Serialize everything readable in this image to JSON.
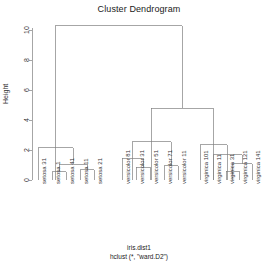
{
  "title": "Cluster Dendrogram",
  "axis": {
    "ylabel": "Height",
    "yticks": [
      "0",
      "2",
      "4",
      "6",
      "8",
      "10"
    ]
  },
  "caption": {
    "line1": "iris.dist1",
    "line2": "hclust (*, \"ward.D2\")"
  },
  "colors": {
    "line": "#808080",
    "axis": "#808080",
    "text": "#1a1a1a"
  },
  "chart_data": {
    "type": "dendrogram",
    "title": "Cluster Dendrogram",
    "xlabel": "iris.dist1",
    "sublabel": "hclust (*, \"ward.D2\")",
    "ylabel": "Height",
    "ylim": [
      0,
      10.8
    ],
    "ytick_values": [
      0,
      2,
      4,
      6,
      8,
      10
    ],
    "grid": false,
    "leaf_labels": [
      "setosa 31",
      "setosa 1",
      "setosa 41",
      "setosa 11",
      "setosa 21",
      "versicolor 81",
      "versicolor 31",
      "versicolor 51",
      "versicolor 71",
      "versicolor 11",
      "virginica 101",
      "virginica 11",
      "virginica 31",
      "virginica 121",
      "virginica 141"
    ],
    "leaf_x": [
      38,
      52,
      66,
      80,
      94,
      122,
      136,
      150,
      164,
      178,
      200,
      213,
      226,
      239,
      252
    ],
    "merges": [
      {
        "id": "m1",
        "left_x": 52,
        "right_x": 66,
        "height": 0.55
      },
      {
        "id": "m2",
        "left_x": 80,
        "right_x": 94,
        "height": 0.7
      },
      {
        "id": "m3",
        "left_x": 59,
        "right_x": 87,
        "height": 1.05
      },
      {
        "id": "m4",
        "left_x": 38,
        "right_x": 73,
        "height": 2.15
      },
      {
        "id": "m5",
        "left_x": 136,
        "right_x": 150,
        "height": 0.85
      },
      {
        "id": "m6",
        "left_x": 122,
        "right_x": 143,
        "height": 1.45
      },
      {
        "id": "m7",
        "left_x": 164,
        "right_x": 178,
        "height": 0.95
      },
      {
        "id": "m8",
        "left_x": 132,
        "right_x": 171,
        "height": 2.55
      },
      {
        "id": "m9",
        "left_x": 226,
        "right_x": 239,
        "height": 0.6
      },
      {
        "id": "m10",
        "left_x": 232,
        "right_x": 252,
        "height": 1.1
      },
      {
        "id": "m11",
        "left_x": 213,
        "right_x": 242,
        "height": 1.7
      },
      {
        "id": "m12",
        "left_x": 200,
        "right_x": 227,
        "height": 2.35
      },
      {
        "id": "m13",
        "left_x": 151,
        "right_x": 213,
        "height": 4.8
      },
      {
        "id": "m14",
        "left_x": 55,
        "right_x": 182,
        "height": 10.3
      }
    ]
  }
}
